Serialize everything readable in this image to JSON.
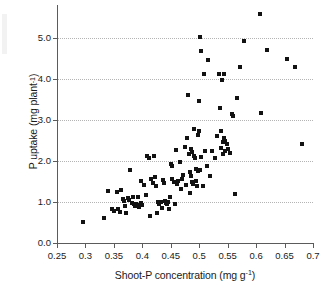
{
  "chart_data": {
    "type": "scatter",
    "title": "",
    "xlabel": "Shoot-P concentration (mg g⁻¹)",
    "xlabel_text": "Shoot-P concentration (mg g",
    "xlabel_sup": "-1",
    "xlabel_tail": ")",
    "ylabel": "P uptake (mg plant⁻¹)",
    "ylabel_text": "P uptake (mg plant",
    "ylabel_sup": "-1",
    "ylabel_tail": ")",
    "xlim": [
      0.25,
      0.7
    ],
    "ylim": [
      0.0,
      5.8
    ],
    "xticks": [
      0.25,
      0.3,
      0.35,
      0.4,
      0.45,
      0.5,
      0.55,
      0.6,
      0.65,
      0.7
    ],
    "xtick_labels": [
      "0.25",
      "0.3",
      "0.35",
      "0.4",
      "0.45",
      "0.5",
      "0.55",
      "0.6",
      "0.65",
      "0.7"
    ],
    "yticks": [
      0.0,
      1.0,
      2.0,
      3.0,
      4.0,
      5.0
    ],
    "ytick_labels": [
      "0.0",
      "1.0",
      "2.0",
      "3.0",
      "4.0",
      "5.0"
    ],
    "grid": "horizontal-dotted",
    "grid_color": "#b4b4b4",
    "axis_color": "#5b5b5b",
    "marker": "square",
    "marker_color": "#121212",
    "marker_size_px": 4,
    "legend": null,
    "n_points": 128,
    "points": [
      [
        0.296,
        0.5
      ],
      [
        0.332,
        0.61
      ],
      [
        0.339,
        1.27
      ],
      [
        0.347,
        0.84
      ],
      [
        0.351,
        0.78
      ],
      [
        0.355,
        1.24
      ],
      [
        0.357,
        0.83
      ],
      [
        0.36,
        0.76
      ],
      [
        0.363,
        1.28
      ],
      [
        0.366,
        1.08
      ],
      [
        0.368,
        1.02
      ],
      [
        0.37,
        0.9
      ],
      [
        0.372,
        0.73
      ],
      [
        0.374,
        1.1
      ],
      [
        0.377,
        1.06
      ],
      [
        0.379,
        1.78
      ],
      [
        0.381,
        0.98
      ],
      [
        0.383,
        1.13
      ],
      [
        0.385,
        0.94
      ],
      [
        0.387,
        0.91
      ],
      [
        0.389,
        0.96
      ],
      [
        0.391,
        0.93
      ],
      [
        0.393,
        1.12
      ],
      [
        0.395,
        0.88
      ],
      [
        0.397,
        1.52
      ],
      [
        0.398,
        0.97
      ],
      [
        0.4,
        0.92
      ],
      [
        0.403,
        1.41
      ],
      [
        0.406,
        1.16
      ],
      [
        0.409,
        2.12
      ],
      [
        0.411,
        2.07
      ],
      [
        0.413,
        0.67
      ],
      [
        0.415,
        1.55
      ],
      [
        0.418,
        1.47
      ],
      [
        0.42,
        2.11
      ],
      [
        0.422,
        1.62
      ],
      [
        0.424,
        1.38
      ],
      [
        0.426,
        0.72
      ],
      [
        0.428,
        1.0
      ],
      [
        0.43,
        0.95
      ],
      [
        0.432,
        0.99
      ],
      [
        0.434,
        0.86
      ],
      [
        0.436,
        1.53
      ],
      [
        0.438,
        1.46
      ],
      [
        0.439,
        1.02
      ],
      [
        0.441,
        0.97
      ],
      [
        0.443,
        0.94
      ],
      [
        0.445,
        1.01
      ],
      [
        0.446,
        0.83
      ],
      [
        0.448,
        1.12
      ],
      [
        0.45,
        1.92
      ],
      [
        0.452,
        1.88
      ],
      [
        0.453,
        1.55
      ],
      [
        0.455,
        1.49
      ],
      [
        0.457,
        0.96
      ],
      [
        0.459,
        2.26
      ],
      [
        0.461,
        1.44
      ],
      [
        0.463,
        1.51
      ],
      [
        0.466,
        1.98
      ],
      [
        0.468,
        1.31
      ],
      [
        0.47,
        1.56
      ],
      [
        0.472,
        1.66
      ],
      [
        0.475,
        2.34
      ],
      [
        0.477,
        1.42
      ],
      [
        0.479,
        2.55
      ],
      [
        0.481,
        3.6
      ],
      [
        0.482,
        2.17
      ],
      [
        0.483,
        1.74
      ],
      [
        0.484,
        1.21
      ],
      [
        0.485,
        1.63
      ],
      [
        0.486,
        2.29
      ],
      [
        0.487,
        1.48
      ],
      [
        0.488,
        2.22
      ],
      [
        0.489,
        1.44
      ],
      [
        0.49,
        2.12
      ],
      [
        0.491,
        2.78
      ],
      [
        0.492,
        2.07
      ],
      [
        0.494,
        1.52
      ],
      [
        0.495,
        1.81
      ],
      [
        0.496,
        1.39
      ],
      [
        0.497,
        2.62
      ],
      [
        0.498,
        1.76
      ],
      [
        0.499,
        3.45
      ],
      [
        0.5,
        2.73
      ],
      [
        0.501,
        1.79
      ],
      [
        0.502,
        5.01
      ],
      [
        0.503,
        2.1
      ],
      [
        0.504,
        4.68
      ],
      [
        0.506,
        1.38
      ],
      [
        0.508,
        4.11
      ],
      [
        0.511,
        2.23
      ],
      [
        0.513,
        1.87
      ],
      [
        0.516,
        4.47
      ],
      [
        0.519,
        1.64
      ],
      [
        0.522,
        2.24
      ],
      [
        0.527,
        2.08
      ],
      [
        0.531,
        2.6
      ],
      [
        0.534,
        4.13
      ],
      [
        0.536,
        3.3
      ],
      [
        0.538,
        2.72
      ],
      [
        0.539,
        2.32
      ],
      [
        0.54,
        3.97
      ],
      [
        0.541,
        2.45
      ],
      [
        0.542,
        2.17
      ],
      [
        0.543,
        4.12
      ],
      [
        0.544,
        2.57
      ],
      [
        0.545,
        2.49
      ],
      [
        0.546,
        2.25
      ],
      [
        0.548,
        2.41
      ],
      [
        0.551,
        2.29
      ],
      [
        0.554,
        2.19
      ],
      [
        0.557,
        3.14
      ],
      [
        0.56,
        3.09
      ],
      [
        0.563,
        1.19
      ],
      [
        0.566,
        3.53
      ],
      [
        0.572,
        4.3
      ],
      [
        0.579,
        4.93
      ],
      [
        0.607,
        5.57
      ],
      [
        0.608,
        3.18
      ],
      [
        0.619,
        4.7
      ],
      [
        0.655,
        4.48
      ],
      [
        0.668,
        4.29
      ],
      [
        0.68,
        2.41
      ]
    ]
  }
}
